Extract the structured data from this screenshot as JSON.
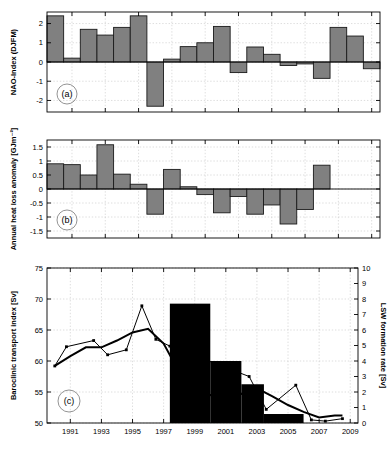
{
  "figure": {
    "width": 390,
    "height": 450,
    "background": "#ffffff",
    "panels": [
      "a",
      "b",
      "c"
    ]
  },
  "colors": {
    "bar_gray": "#808080",
    "bar_edge": "#1a1a1a",
    "bar_black": "#000000",
    "line": "#000000",
    "grid": "#c8c8c8",
    "axis": "#000000"
  },
  "chart_data": [
    {
      "id": "panel-a",
      "tag": "(a)",
      "type": "bar",
      "title": "",
      "xlabel": "",
      "ylabel": "NAO-Index (DJFM)",
      "ylim": [
        -2.6,
        2.6
      ],
      "yticks": [
        -2,
        -1,
        0,
        1,
        2
      ],
      "ytick_labels": [
        "-2",
        "-1",
        "0",
        "1",
        "2"
      ],
      "xlim": [
        1989.5,
        2009.5
      ],
      "xticks": [
        1991,
        1993,
        1995,
        1997,
        1999,
        2001,
        2003,
        2005,
        2007,
        2009
      ],
      "grid": true,
      "categories": [
        1990,
        1991,
        1992,
        1993,
        1994,
        1995,
        1996,
        1997,
        1998,
        1999,
        2000,
        2001,
        2002,
        2003,
        2004,
        2005,
        2006,
        2007,
        2008,
        2009
      ],
      "values": [
        2.4,
        0.2,
        1.7,
        1.4,
        1.8,
        2.4,
        -2.3,
        0.15,
        0.8,
        1.0,
        1.85,
        -0.55,
        0.78,
        0.4,
        -0.18,
        -0.1,
        -0.85,
        1.8,
        1.35,
        -0.35
      ]
    },
    {
      "id": "panel-b",
      "tag": "(b)",
      "type": "bar",
      "title": "",
      "xlabel": "",
      "ylabel": "Annual heat loss anomaly [GJm⁻²]",
      "ylim": [
        -1.75,
        1.75
      ],
      "yticks": [
        -1.5,
        -1,
        -0.5,
        0,
        0.5,
        1,
        1.5
      ],
      "ytick_labels": [
        "-1.5",
        "-1",
        "-0.5",
        "0",
        "0.5",
        "1",
        "1.5"
      ],
      "xlim": [
        1989.5,
        2009.5
      ],
      "xticks": [
        1991,
        1993,
        1995,
        1997,
        1999,
        2001,
        2003,
        2005,
        2007,
        2009
      ],
      "grid": true,
      "categories": [
        1990,
        1991,
        1992,
        1993,
        1994,
        1995,
        1996,
        1997,
        1998,
        1999,
        2000,
        2001,
        2002,
        2003,
        2004,
        2005,
        2006,
        2007,
        2008,
        2009
      ],
      "values": [
        0.9,
        0.87,
        0.5,
        1.58,
        0.53,
        0.17,
        -0.9,
        0.7,
        0.08,
        -0.2,
        -0.85,
        -0.27,
        -0.9,
        -0.57,
        -1.25,
        -0.73,
        0.85
      ]
    },
    {
      "id": "panel-c",
      "tag": "(c)",
      "type": "line",
      "title": "",
      "xlabel": "",
      "ylabel": "Baroclinic transport index [Sv]",
      "ylabel_right": "LSW formation rate [Sv]",
      "ylim": [
        50,
        75
      ],
      "yticks": [
        50,
        55,
        60,
        65,
        70,
        75
      ],
      "ytick_labels": [
        "50",
        "55",
        "60",
        "65",
        "70",
        "75"
      ],
      "ylim_right": [
        0,
        10
      ],
      "yticks_right": [
        0,
        1,
        2,
        3,
        4,
        5,
        6,
        7,
        8,
        9,
        10
      ],
      "ytick_labels_right": [
        "0",
        "1",
        "2",
        "3",
        "4",
        "5",
        "6",
        "7",
        "8",
        "9",
        "10"
      ],
      "xlim": [
        1989.5,
        2009.5
      ],
      "xticks": [
        1991,
        1993,
        1995,
        1997,
        1999,
        2001,
        2003,
        2005,
        2007,
        2009
      ],
      "xtick_labels": [
        "1991",
        "1993",
        "1995",
        "1997",
        "1999",
        "2001",
        "2003",
        "2005",
        "2007",
        "2009"
      ],
      "grid": true,
      "series": [
        {
          "name": "baroclinic-transport-thin-markers",
          "style": "thin-with-markers",
          "x": [
            1990.0,
            1990.75,
            1992.5,
            1993.4,
            1994.6,
            1995.6,
            1996.5,
            1997.4,
            2002.5,
            2003.6,
            2005.5,
            2006.5,
            2007.4,
            2008.5
          ],
          "y": [
            59.2,
            62.3,
            63.3,
            61.0,
            61.8,
            68.9,
            63.5,
            62.4,
            57.5,
            52.2,
            56.1,
            50.5,
            50.3,
            50.7
          ]
        },
        {
          "name": "lsw-derived-thick-line",
          "style": "thick",
          "x": [
            1990.0,
            1991.0,
            1992.0,
            1993.0,
            1994.0,
            1995.0,
            1996.0,
            1997.0,
            1998.0,
            1999.0,
            2000.0,
            2001.0,
            2002.0,
            2003.0,
            2004.0,
            2005.0,
            2006.0,
            2007.0,
            2008.0,
            2008.5
          ],
          "y": [
            59.2,
            60.8,
            62.2,
            62.2,
            63.3,
            64.6,
            65.2,
            62.8,
            58.2,
            56.0,
            54.5,
            55.1,
            54.7,
            55.6,
            54.3,
            52.9,
            51.8,
            50.9,
            51.2,
            51.2
          ]
        }
      ],
      "bars_right_axis": {
        "name": "lsw-formation-rate",
        "color": "#000000",
        "segments": [
          {
            "x0": 1997.4,
            "x1": 2000.0,
            "value": 7.7
          },
          {
            "x0": 2000.0,
            "x1": 2002.0,
            "value": 4.0
          },
          {
            "x0": 2002.0,
            "x1": 2003.45,
            "value": 2.5
          },
          {
            "x0": 2003.45,
            "x1": 2006.0,
            "value": 0.58
          }
        ]
      }
    }
  ]
}
